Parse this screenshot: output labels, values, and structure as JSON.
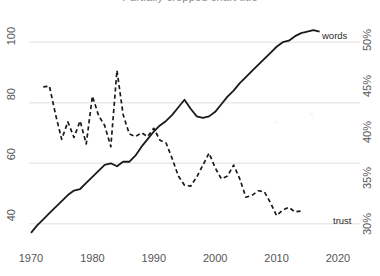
{
  "title_fragment": "Partially cropped chart title",
  "chart_data": {
    "type": "line",
    "title": "",
    "xlabel": "",
    "ylabel": "",
    "grid": true,
    "legend_position": "inline-right-end",
    "x": [
      1970,
      1980,
      1990,
      2000,
      2010,
      2020
    ],
    "xlim": [
      1970,
      2020
    ],
    "axes": {
      "left": {
        "ticks": [
          40,
          60,
          80,
          100
        ],
        "ticklabels": [
          "40",
          "60",
          "80",
          "100"
        ],
        "ylim": [
          33,
          108
        ],
        "label": "",
        "rotated": true
      },
      "right": {
        "ticks": [
          30,
          35,
          40,
          45,
          50
        ],
        "ticklabels": [
          "30%",
          "35%",
          "40%",
          "45%",
          "50%"
        ],
        "ylim": [
          27.8,
          52.5
        ],
        "label": "",
        "rotated": true
      }
    },
    "xticklabels": [
      "1970",
      "1980",
      "1990",
      "2000",
      "2010",
      "2020"
    ],
    "series": [
      {
        "name": "words",
        "label": "words",
        "axis": "left",
        "style": "solid",
        "color": "#1a1a1a",
        "points": [
          [
            1970,
            37.0
          ],
          [
            1971,
            39.5
          ],
          [
            1972,
            41.5
          ],
          [
            1973,
            43.5
          ],
          [
            1974,
            45.5
          ],
          [
            1975,
            47.5
          ],
          [
            1976,
            49.5
          ],
          [
            1977,
            51.0
          ],
          [
            1978,
            51.5
          ],
          [
            1979,
            53.5
          ],
          [
            1980,
            55.5
          ],
          [
            1981,
            57.5
          ],
          [
            1982,
            59.5
          ],
          [
            1983,
            60.0
          ],
          [
            1984,
            59.0
          ],
          [
            1985,
            60.5
          ],
          [
            1986,
            60.5
          ],
          [
            1987,
            62.5
          ],
          [
            1988,
            65.5
          ],
          [
            1989,
            68.0
          ],
          [
            1990,
            70.5
          ],
          [
            1991,
            72.5
          ],
          [
            1992,
            74.0
          ],
          [
            1993,
            76.0
          ],
          [
            1994,
            78.5
          ],
          [
            1995,
            81.0
          ],
          [
            1996,
            78.0
          ],
          [
            1997,
            75.5
          ],
          [
            1998,
            75.0
          ],
          [
            1999,
            75.5
          ],
          [
            2000,
            77.0
          ],
          [
            2001,
            79.5
          ],
          [
            2002,
            82.0
          ],
          [
            2003,
            84.0
          ],
          [
            2004,
            86.5
          ],
          [
            2005,
            88.5
          ],
          [
            2006,
            90.5
          ],
          [
            2007,
            92.5
          ],
          [
            2008,
            94.5
          ],
          [
            2009,
            96.5
          ],
          [
            2010,
            98.5
          ],
          [
            2011,
            100.0
          ],
          [
            2012,
            100.5
          ],
          [
            2013,
            102.0
          ],
          [
            2014,
            103.0
          ],
          [
            2015,
            103.5
          ],
          [
            2016,
            104.0
          ],
          [
            2017,
            103.5
          ]
        ]
      },
      {
        "name": "trust",
        "label": "trust",
        "axis": "right",
        "style": "dashed",
        "color": "#1a1a1a",
        "points": [
          [
            1972,
            45.0
          ],
          [
            1973,
            45.1
          ],
          [
            1974,
            42.0
          ],
          [
            1975,
            39.3
          ],
          [
            1976,
            41.2
          ],
          [
            1977,
            39.5
          ],
          [
            1978,
            41.3
          ],
          [
            1979,
            38.8
          ],
          [
            1980,
            44.0
          ],
          [
            1981,
            41.9
          ],
          [
            1982,
            40.8
          ],
          [
            1983,
            38.5
          ],
          [
            1984,
            46.8
          ],
          [
            1985,
            42.0
          ],
          [
            1986,
            39.9
          ],
          [
            1987,
            39.6
          ],
          [
            1988,
            40.0
          ],
          [
            1989,
            39.6
          ],
          [
            1990,
            40.5
          ],
          [
            1991,
            39.2
          ],
          [
            1992,
            38.9
          ],
          [
            1993,
            37.2
          ],
          [
            1994,
            35.3
          ],
          [
            1995,
            34.3
          ],
          [
            1996,
            34.2
          ],
          [
            1997,
            35.2
          ],
          [
            1998,
            36.5
          ],
          [
            1999,
            37.8
          ],
          [
            2000,
            36.2
          ],
          [
            2001,
            35.0
          ],
          [
            2002,
            35.3
          ],
          [
            2003,
            36.5
          ],
          [
            2004,
            35.0
          ],
          [
            2005,
            33.0
          ],
          [
            2006,
            33.2
          ],
          [
            2007,
            33.7
          ],
          [
            2008,
            33.6
          ],
          [
            2009,
            32.4
          ],
          [
            2010,
            31.0
          ],
          [
            2011,
            31.6
          ],
          [
            2012,
            31.9
          ],
          [
            2013,
            31.4
          ],
          [
            2014,
            31.5
          ]
        ]
      }
    ]
  }
}
